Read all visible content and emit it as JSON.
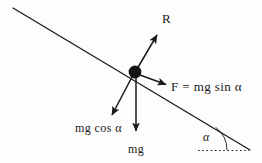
{
  "diagram": {
    "background_color": "#fdfdfd",
    "stroke_color": "#1a1a1a",
    "labels": {
      "normal_force": "R",
      "parallel_force": "F = mg sin α",
      "perpendicular_component": "mg cos α",
      "weight": "mg",
      "incline_angle": "α"
    },
    "geometry": {
      "incline_start": [
        13,
        8
      ],
      "incline_end": [
        250,
        150
      ],
      "block_center": [
        135,
        72
      ],
      "block_radius": 6,
      "normal_arrow_tip": [
        158,
        34
      ],
      "parallel_arrow_tip": [
        167,
        85
      ],
      "perpendicular_arrow_tip": [
        111,
        116
      ],
      "weight_arrow_tip": [
        136,
        133
      ],
      "baseline_start": [
        198,
        150
      ],
      "baseline_end": [
        249,
        150
      ]
    }
  }
}
